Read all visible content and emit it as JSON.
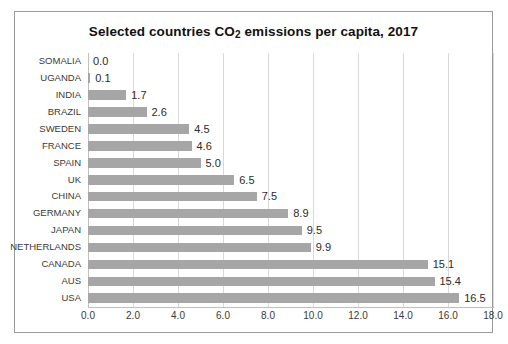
{
  "chart_data": {
    "type": "bar",
    "orientation": "horizontal",
    "title": "Selected countries CO2 emissions per capita, 2017",
    "title_main": "Selected countries CO",
    "title_sub": "2",
    "title_tail": " emissions per capita, 2017",
    "xlabel": "",
    "ylabel": "",
    "xlim": [
      0.0,
      18.0
    ],
    "xticks": [
      "0.0",
      "2.0",
      "4.0",
      "6.0",
      "8.0",
      "10.0",
      "12.0",
      "14.0",
      "16.0",
      "18.0"
    ],
    "xtick_values": [
      0,
      2,
      4,
      6,
      8,
      10,
      12,
      14,
      16,
      18
    ],
    "grid": "vertical",
    "legend": "none",
    "bar_color": "#a6a6a6",
    "categories": [
      "SOMALIA",
      "UGANDA",
      "INDIA",
      "BRAZIL",
      "SWEDEN",
      "FRANCE",
      "SPAIN",
      "UK",
      "CHINA",
      "GERMANY",
      "JAPAN",
      "NETHERLANDS",
      "CANADA",
      "AUS",
      "USA"
    ],
    "values": [
      0.0,
      0.1,
      1.7,
      2.6,
      4.5,
      4.6,
      5.0,
      6.5,
      7.5,
      8.9,
      9.5,
      9.9,
      15.1,
      15.4,
      16.5
    ],
    "data_labels": [
      "0.0",
      "0.1",
      "1.7",
      "2.6",
      "4.5",
      "4.6",
      "5.0",
      "6.5",
      "7.5",
      "8.9",
      "9.5",
      "9.9",
      "15.1",
      "15.4",
      "16.5"
    ]
  }
}
